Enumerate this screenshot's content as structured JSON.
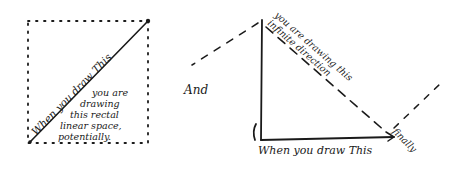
{
  "image": {
    "width": 461,
    "height": 186,
    "background": "#ffffff",
    "ink_color": "#1a1a1a",
    "style": "hand-drawn sketch",
    "transcription_note": "All text is handwritten; transcriptions are best-effort readings. Rotated text along diagonals is least certain."
  },
  "left_figure": {
    "shape": "dotted rectangle with solid diagonal",
    "diagonal_label": {
      "text": "When you draw This",
      "legibility": "approximate"
    },
    "note_lines": [
      {
        "text": "you are",
        "legibility": "approximate"
      },
      {
        "text": "drawing",
        "legibility": "approximate"
      },
      {
        "text": "this rectal",
        "legibility": "uncertain"
      },
      {
        "text": "linear space,",
        "legibility": "approximate"
      },
      {
        "text": "potentially.",
        "legibility": "approximate"
      }
    ]
  },
  "connector": {
    "text": "And",
    "legibility": "approximate"
  },
  "right_figure": {
    "shape": "right triangle with dashed extended hypotenuse",
    "hypotenuse_label_outer": {
      "text": "you are drawing this",
      "legibility": "uncertain"
    },
    "hypotenuse_label_inner": {
      "text": "infinite direction",
      "legibility": "uncertain"
    },
    "base_label": {
      "text": "When you draw This",
      "legibility": "approximate"
    },
    "corner_label": {
      "text": "finally",
      "legibility": "uncertain"
    }
  }
}
